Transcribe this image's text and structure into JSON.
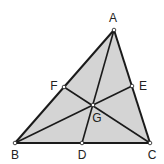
{
  "diagram": {
    "colors": {
      "fill": "#d4d4d4",
      "stroke": "#1a1a1a",
      "point_fill": "#ffffff",
      "label": "#222222"
    },
    "points": {
      "A": {
        "label": "A",
        "x": 114,
        "y": 30,
        "lx": 113,
        "ly": 22
      },
      "B": {
        "label": "B",
        "x": 15,
        "y": 143,
        "lx": 15,
        "ly": 159
      },
      "C": {
        "label": "C",
        "x": 150,
        "y": 143,
        "lx": 152,
        "ly": 159
      },
      "D": {
        "label": "D",
        "x": 82,
        "y": 143,
        "lx": 82,
        "ly": 159
      },
      "E": {
        "label": "E",
        "x": 132,
        "y": 86,
        "lx": 143,
        "ly": 90
      },
      "F": {
        "label": "F",
        "x": 64,
        "y": 87,
        "lx": 54,
        "ly": 90
      },
      "G": {
        "label": "G",
        "x": 93,
        "y": 105,
        "lx": 97,
        "ly": 122
      }
    },
    "segments": [
      {
        "from": "A",
        "to": "B",
        "kind": "side"
      },
      {
        "from": "B",
        "to": "C",
        "kind": "side"
      },
      {
        "from": "C",
        "to": "A",
        "kind": "side"
      },
      {
        "from": "A",
        "to": "D",
        "kind": "median"
      },
      {
        "from": "B",
        "to": "E",
        "kind": "median"
      },
      {
        "from": "C",
        "to": "F",
        "kind": "median"
      }
    ]
  }
}
